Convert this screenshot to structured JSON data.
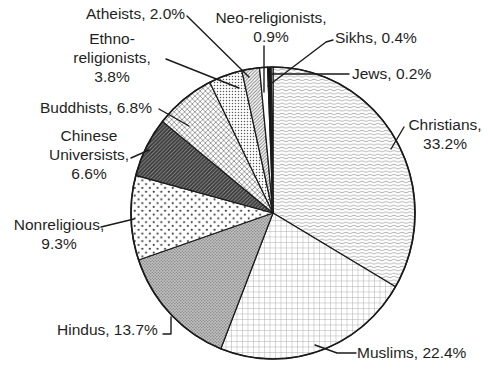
{
  "figure": {
    "background": "#ffffff",
    "ink_color": "#1a1a1a",
    "text_color": "#1f1f1f"
  },
  "chart_data": {
    "type": "pie",
    "title": "",
    "legend_position": "none",
    "label_style": "outside-callouts-with-leader-lines",
    "start_angle_deg": 0,
    "direction": "clockwise",
    "slices": [
      {
        "label": "Christians",
        "value": 33.2,
        "pattern": "waves"
      },
      {
        "label": "Muslims",
        "value": 22.4,
        "pattern": "grid"
      },
      {
        "label": "Hindus",
        "value": 13.7,
        "pattern": "gray-dots"
      },
      {
        "label": "Nonreligious",
        "value": 9.3,
        "pattern": "sparse-dots"
      },
      {
        "label": "Chinese Universists",
        "value": 6.6,
        "pattern": "dark-stripes"
      },
      {
        "label": "Buddhists",
        "value": 6.8,
        "pattern": "crosshatch"
      },
      {
        "label": "Ethno-religionists",
        "value": 3.8,
        "pattern": "fine-dots"
      },
      {
        "label": "Atheists",
        "value": 2.0,
        "pattern": "hatch"
      },
      {
        "label": "Neo-religionists",
        "value": 0.9,
        "pattern": "white"
      },
      {
        "label": "Sikhs",
        "value": 0.4,
        "pattern": "black"
      },
      {
        "label": "Jews",
        "value": 0.2,
        "pattern": "white"
      }
    ]
  },
  "labels": {
    "atheists": {
      "line1": "Atheists, 2.0%"
    },
    "neo": {
      "line1": "Neo-religionists,",
      "line2": "0.9%"
    },
    "sikhs": {
      "line1": "Sikhs, 0.4%"
    },
    "jews": {
      "line1": "Jews, 0.2%"
    },
    "ethno": {
      "line1": "Ethno-",
      "line2": "religionists,",
      "line3": "3.8%"
    },
    "buddhists": {
      "line1": "Buddhists, 6.8%"
    },
    "chinese": {
      "line1": "Chinese",
      "line2": "Universists,",
      "line3": "6.6%"
    },
    "nonreligious": {
      "line1": "Nonreligious,",
      "line2": "9.3%"
    },
    "hindus": {
      "line1": "Hindus, 13.7%"
    },
    "muslims": {
      "line1": "Muslims, 22.4%"
    },
    "christians": {
      "line1": "Christians,",
      "line2": "33.2%"
    }
  }
}
